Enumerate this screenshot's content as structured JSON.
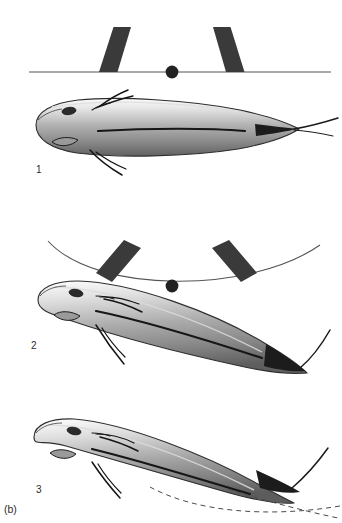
{
  "figure": {
    "caption_label": "(b)",
    "background_color": "#ffffff",
    "width": 342,
    "height": 523
  },
  "panels": [
    {
      "number": "1",
      "state": "straight",
      "axis": {
        "type": "line",
        "color": "#555555",
        "x_start": 29,
        "x_end": 331,
        "y": 72,
        "curvature": 0
      },
      "center_dot": {
        "cx": 172,
        "cy": 72,
        "r": 6.5,
        "color": "#222222"
      },
      "bars": [
        {
          "side": "left",
          "color": "#3a3a3a",
          "angle_deg": -14
        },
        {
          "side": "right",
          "color": "#3a3a3a",
          "angle_deg": 14
        }
      ],
      "fish": {
        "curvature": "none",
        "label_x": 36,
        "label_y": 164
      }
    },
    {
      "number": "2",
      "state": "moderately-bent",
      "axis": {
        "type": "arc",
        "color": "#555555",
        "x_start": 48,
        "x_end": 320,
        "y": 282,
        "curvature": -42
      },
      "center_dot": {
        "cx": 172,
        "cy": 285,
        "r": 6.5,
        "color": "#222222"
      },
      "bars": [
        {
          "side": "left",
          "color": "#3a3a3a",
          "angle_deg": -38
        },
        {
          "side": "right",
          "color": "#3a3a3a",
          "angle_deg": 38
        }
      ],
      "fish": {
        "curvature": "moderate",
        "label_x": 31,
        "label_y": 340
      }
    },
    {
      "number": "3",
      "state": "fully-bent",
      "axis": {
        "type": "hidden",
        "color": "#555555"
      },
      "center_dot": null,
      "bars": [],
      "dashed_traces": [
        {
          "name": "dashed-arc-trace",
          "color": "#4a4a4a",
          "dash": "5,4"
        },
        {
          "name": "dashed-diagonal-trace",
          "color": "#4a4a4a",
          "dash": "5,4"
        }
      ],
      "fish": {
        "curvature": "strong",
        "label_x": 36,
        "label_y": 484
      }
    }
  ],
  "fish_anatomy": {
    "body_gradient_top": "#f2f2f2",
    "body_gradient_mid": "#b8b8b8",
    "body_gradient_bottom": "#6e6e6e",
    "outline_color": "#2e2e2e",
    "eye_color": "#2b2b2b",
    "fin_color": "#1a1a1a",
    "parts": [
      "eye",
      "operculum",
      "pectoral-fin",
      "pelvic-fin",
      "lateral-line",
      "dorsal-ridge",
      "caudal-filament"
    ]
  }
}
